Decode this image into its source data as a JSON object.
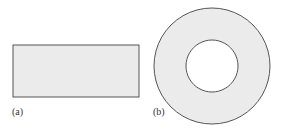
{
  "figure": {
    "panels": [
      {
        "label": "(a)",
        "shape": "rectangle",
        "fill": "#ebebeb",
        "stroke": "#555555"
      },
      {
        "label": "(b)",
        "shape": "annulus",
        "fill": "#ebebeb",
        "stroke": "#555555"
      }
    ]
  }
}
